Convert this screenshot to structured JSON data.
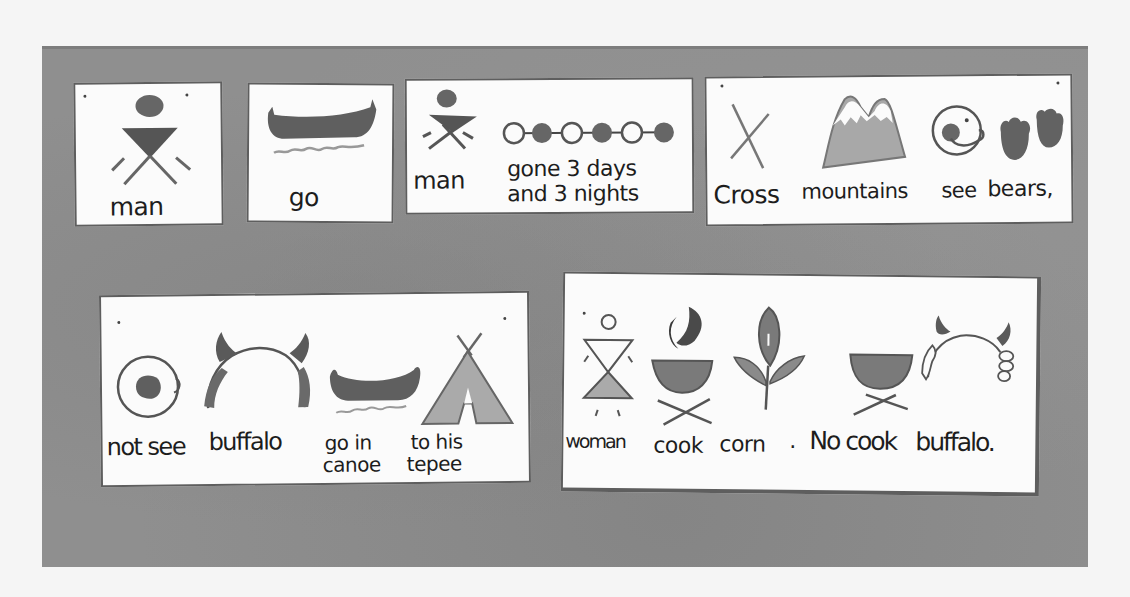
{
  "colors": {
    "board": "#8f8f8f",
    "card": "#fbfbfb",
    "ink": "#1d1d1d",
    "dark_fill": "#646464",
    "light_fill": "#a6a6a6"
  },
  "rows": [
    {
      "cards": [
        {
          "id": "card-man",
          "words": [
            {
              "icon": "man-icon",
              "label": "man"
            }
          ]
        },
        {
          "id": "card-go",
          "words": [
            {
              "icon": "canoe-icon",
              "label": "go"
            }
          ]
        },
        {
          "id": "card-man-gone",
          "words": [
            {
              "icon": "man-icon",
              "label": "man"
            },
            {
              "icon": "days-nights-icon",
              "label_line1": "gone 3 days",
              "label_line2": "and 3 nights"
            }
          ]
        },
        {
          "id": "card-cross-mountains",
          "words": [
            {
              "icon": "cross-icon",
              "label": "Cross"
            },
            {
              "icon": "mountains-icon",
              "label": "mountains"
            },
            {
              "icon": "eye-icon",
              "label": "see"
            },
            {
              "icon": "bear-paws-icon",
              "label": "bears,"
            }
          ]
        }
      ]
    },
    {
      "cards": [
        {
          "id": "card-not-see-buffalo",
          "words": [
            {
              "icon": "closed-eye-icon",
              "label": "not see"
            },
            {
              "icon": "buffalo-icon",
              "label": "buffalo"
            },
            {
              "icon": "canoe-icon",
              "label_line1": "go in",
              "label_line2": "canoe"
            },
            {
              "icon": "tepee-icon",
              "label_line1": "to his",
              "label_line2": "tepee"
            }
          ]
        },
        {
          "id": "card-woman-cook",
          "words": [
            {
              "icon": "woman-icon",
              "label": "woman"
            },
            {
              "icon": "cooking-pot-fire-icon",
              "label": "cook"
            },
            {
              "icon": "corn-icon",
              "label": "corn"
            },
            {
              "icon": "period",
              "label": "."
            },
            {
              "icon": "empty-pot-icon",
              "label": "No cook"
            },
            {
              "icon": "buffalo-outline-icon",
              "label": "buffalo."
            }
          ]
        }
      ]
    }
  ]
}
